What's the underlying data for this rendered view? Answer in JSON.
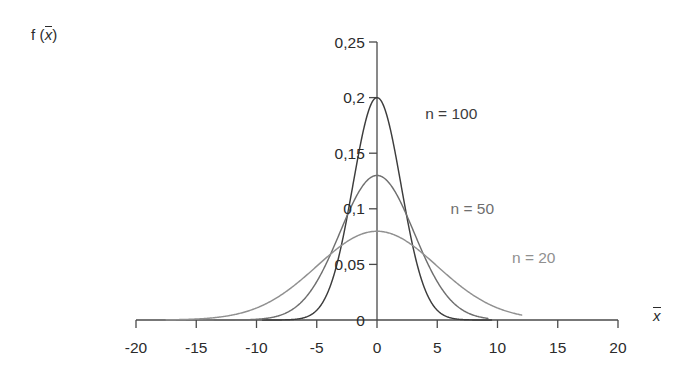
{
  "chart_data": {
    "type": "line",
    "title": "",
    "subtitle": "",
    "xlabel": "x̄",
    "ylabel": "f (x̄)",
    "xlim": [
      -20,
      20
    ],
    "ylim": [
      0,
      0.25
    ],
    "grid": false,
    "legend_position": "inline-annotations",
    "x_ticks": [
      "-20",
      "-15",
      "-10",
      "-5",
      "0",
      "5",
      "10",
      "15",
      "20"
    ],
    "x_tick_values": [
      -20,
      -15,
      -10,
      -5,
      0,
      5,
      10,
      15,
      20
    ],
    "y_ticks": [
      "0",
      "0,05",
      "0,1",
      "0,15",
      "0,2",
      "0,25"
    ],
    "y_tick_values": [
      0,
      0.05,
      0.1,
      0.15,
      0.2,
      0.25
    ],
    "decimal_separator": ",",
    "series": [
      {
        "name": "n = 100",
        "color": "#3d3d3d",
        "mean": 0,
        "sigma": 2.0,
        "peak": 0.2,
        "x_extent": [
          -9.5,
          9.5
        ],
        "label_x": 4.0,
        "label_y": 0.185
      },
      {
        "name": "n = 50",
        "color": "#6f6f6f",
        "mean": 0,
        "sigma": 3.07,
        "peak": 0.13,
        "x_extent": [
          -13.5,
          9.2
        ],
        "label_x": 6.1,
        "label_y": 0.1
      },
      {
        "name": "n = 20",
        "color": "#909090",
        "mean": 0,
        "sigma": 5.0,
        "peak": 0.0798,
        "x_extent": [
          -17.5,
          12.0
        ],
        "label_x": 11.2,
        "label_y": 0.0555
      }
    ]
  },
  "axis": {
    "y_label_text": "f (",
    "y_label_var": "x",
    "y_label_close": ")",
    "x_label_var": "x",
    "axis_color": "#4a4a4a"
  }
}
